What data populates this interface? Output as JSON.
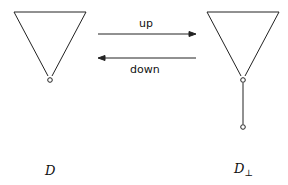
{
  "arrows": {
    "up_label": "up",
    "down_label": "down"
  },
  "nodes": {
    "left_label": "D",
    "right_label": "D",
    "right_subscript": "⊥"
  }
}
